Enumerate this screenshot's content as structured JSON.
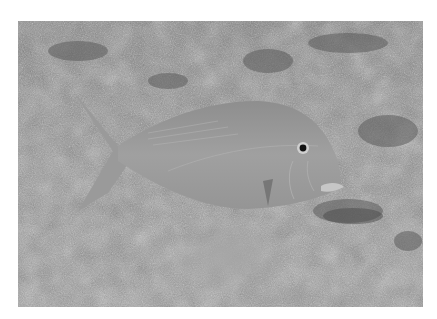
{
  "image": {
    "subject": "fish swimming over sandy seabed",
    "description": "Grayscale underwater photograph of a single fish (emperor/snapper-like) swimming left-to-right just above a rocky, sandy sea floor, with a small cloud of sand below it",
    "colors": {
      "background_border": "#ffffff",
      "seabed_light": "#a8a8a8",
      "seabed_mid": "#8a8a8a",
      "seabed_dark": "#5a5a5a",
      "fish_body": "#9a9a9a",
      "fish_highlight": "#b8b8b8",
      "eye": "#111111"
    }
  }
}
